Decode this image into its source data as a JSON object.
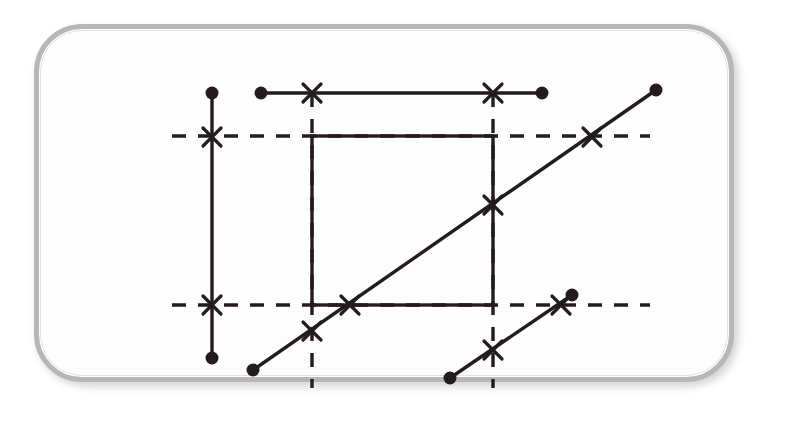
{
  "canvas": {
    "width": 806,
    "height": 437,
    "background": "#ffffff",
    "ink": "#241c1c",
    "frame": {
      "label": "rounded-rectangle-bezel",
      "x": 34,
      "y": 24,
      "width": 700,
      "height": 358,
      "radius": 48,
      "border_color": "#b7b7b7",
      "shadow_color": "#c9c9c9",
      "fill": "#ffffff"
    }
  },
  "diagram": {
    "stroke_color": "#241c1c",
    "solid_stroke_width": 3.4,
    "dashed_stroke_width": 3.4,
    "dash_pattern": "14 12",
    "dot_radius": 6.5,
    "cross_size": 9,
    "solid_segments": [
      {
        "name": "vertical-segment-left",
        "orientation": "vertical",
        "x1": 212,
        "y1": 93,
        "x2": 212,
        "y2": 358,
        "endpoints": [
          "dot",
          "dot"
        ]
      },
      {
        "name": "horizontal-segment-top",
        "orientation": "horizontal",
        "x1": 261,
        "y1": 93,
        "x2": 542,
        "y2": 93,
        "endpoints": [
          "dot",
          "dot"
        ]
      },
      {
        "name": "diagonal-segment-long",
        "orientation": "diagonal",
        "x1": 253,
        "y1": 370,
        "x2": 656,
        "y2": 90,
        "endpoints": [
          "dot",
          "dot"
        ]
      },
      {
        "name": "diagonal-segment-short",
        "orientation": "diagonal",
        "x1": 450,
        "y1": 378,
        "x2": 572,
        "y2": 295,
        "endpoints": [
          "dot",
          "dot"
        ]
      }
    ],
    "rectangle": {
      "name": "center-rectangle",
      "x": 312,
      "y": 136,
      "width": 181,
      "height": 169,
      "style": "solid",
      "fill": "none"
    },
    "dashed_lines": [
      {
        "name": "dashed-horizontal-upper",
        "orientation": "horizontal",
        "x1": 172,
        "y1": 136,
        "x2": 650,
        "y2": 136
      },
      {
        "name": "dashed-horizontal-lower",
        "orientation": "horizontal",
        "x1": 172,
        "y1": 305,
        "x2": 650,
        "y2": 305
      },
      {
        "name": "dashed-vertical-left",
        "orientation": "vertical",
        "x1": 312,
        "y1": 93,
        "x2": 312,
        "y2": 388
      },
      {
        "name": "dashed-vertical-right",
        "orientation": "vertical",
        "x1": 493,
        "y1": 93,
        "x2": 493,
        "y2": 388
      }
    ],
    "dots": [
      {
        "name": "dot-vertical-top",
        "cx": 212,
        "cy": 93
      },
      {
        "name": "dot-vertical-bottom",
        "cx": 212,
        "cy": 358
      },
      {
        "name": "dot-horizontal-left",
        "cx": 261,
        "cy": 93
      },
      {
        "name": "dot-horizontal-right",
        "cx": 542,
        "cy": 93
      },
      {
        "name": "dot-long-diagonal-start",
        "cx": 253,
        "cy": 370
      },
      {
        "name": "dot-long-diagonal-end",
        "cx": 656,
        "cy": 90
      },
      {
        "name": "dot-short-diagonal-start",
        "cx": 450,
        "cy": 378
      },
      {
        "name": "dot-short-diagonal-end",
        "cx": 572,
        "cy": 295
      }
    ],
    "crosses": [
      {
        "name": "cross-vertical-upper",
        "cx": 212,
        "cy": 137,
        "angle": 0
      },
      {
        "name": "cross-vertical-lower",
        "cx": 212,
        "cy": 305,
        "angle": 0
      },
      {
        "name": "cross-top-line-left",
        "cx": 312,
        "cy": 93,
        "angle": 0
      },
      {
        "name": "cross-top-line-right",
        "cx": 493,
        "cy": 93,
        "angle": 0
      },
      {
        "name": "cross-diagonal-rect-right",
        "cx": 493,
        "cy": 205,
        "angle": 0
      },
      {
        "name": "cross-diagonal-dashed-upper",
        "cx": 592,
        "cy": 137,
        "angle": 0
      },
      {
        "name": "cross-diagonal-rect-bottom",
        "cx": 350,
        "cy": 305,
        "angle": 0
      },
      {
        "name": "cross-diagonal-dashed-left",
        "cx": 312,
        "cy": 331,
        "angle": 0
      },
      {
        "name": "cross-short-diagonal-lower",
        "cx": 493,
        "cy": 350,
        "angle": 0
      },
      {
        "name": "cross-short-diagonal-upper",
        "cx": 561,
        "cy": 305,
        "angle": 0
      }
    ]
  }
}
